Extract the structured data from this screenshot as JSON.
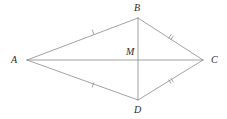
{
  "figure": {
    "kind": "geometry-diagram",
    "shape_name": "kite",
    "background_color": "#ffffff",
    "line_color": "#8a8a8a",
    "label_color": "#2b2b2b",
    "stroke_width": 0.8,
    "canvas": {
      "width": 227,
      "height": 119
    },
    "vertices": [
      {
        "id": "A",
        "label": "A",
        "x": 27,
        "y": 60,
        "label_x": 11,
        "label_y": 55
      },
      {
        "id": "B",
        "label": "B",
        "x": 138,
        "y": 18,
        "label_x": 134,
        "label_y": 3
      },
      {
        "id": "C",
        "label": "C",
        "x": 203,
        "y": 60,
        "label_x": 211,
        "label_y": 55
      },
      {
        "id": "D",
        "label": "D",
        "x": 138,
        "y": 100,
        "label_x": 134,
        "label_y": 105
      },
      {
        "id": "M",
        "label": "M",
        "x": 138,
        "y": 60,
        "label_x": 126,
        "label_y": 47
      }
    ],
    "sides": [
      {
        "id": "AB",
        "from": "A",
        "to": "B",
        "ticks": 1
      },
      {
        "id": "BC",
        "from": "B",
        "to": "C",
        "ticks": 2
      },
      {
        "id": "DC",
        "from": "D",
        "to": "C",
        "ticks": 2
      },
      {
        "id": "AD",
        "from": "A",
        "to": "D",
        "ticks": 1
      }
    ],
    "diagonals": [
      {
        "id": "AC",
        "from": "A",
        "to": "C",
        "ticks": 0
      },
      {
        "id": "BD",
        "from": "B",
        "to": "D",
        "ticks": 0
      }
    ],
    "tick_marks": [
      {
        "id": "tick-AB",
        "on": "AB",
        "count": 1,
        "x": 93,
        "y": 32
      },
      {
        "id": "tick-BC",
        "on": "BC",
        "count": 2,
        "x": 171,
        "y": 37
      },
      {
        "id": "tick-DC",
        "on": "DC",
        "count": 2,
        "x": 171,
        "y": 81
      },
      {
        "id": "tick-AD",
        "on": "AD",
        "count": 1,
        "x": 93,
        "y": 85
      }
    ]
  }
}
